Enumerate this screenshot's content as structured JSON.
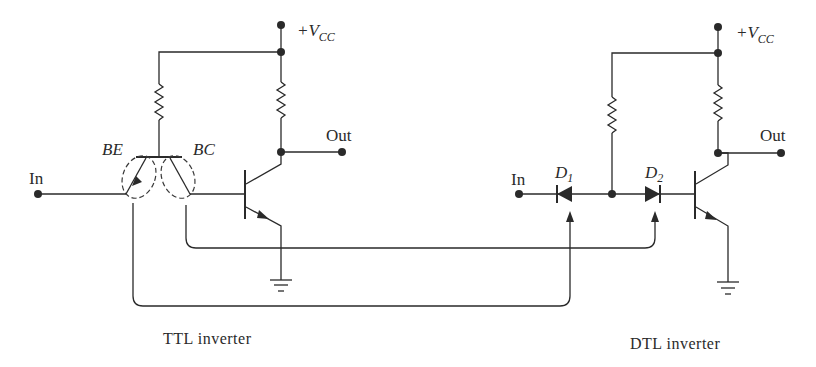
{
  "figure": {
    "type": "circuit-diagram",
    "colors": {
      "ink": "#2a2a2a",
      "background": "#ffffff"
    }
  },
  "ttl": {
    "caption": "TTL inverter",
    "supply_label_prefix": "+V",
    "supply_label_sub": "CC",
    "out_label": "Out",
    "in_label": "In",
    "junction_be_label": "BE",
    "junction_bc_label": "BC"
  },
  "dtl": {
    "caption": "DTL inverter",
    "supply_label_prefix": "+V",
    "supply_label_sub": "CC",
    "out_label": "Out",
    "in_label": "In",
    "d1_label": "D",
    "d1_sub": "1",
    "d2_label": "D",
    "d2_sub": "2"
  },
  "mapping": [
    {
      "from": "BE junction",
      "to": "D1"
    },
    {
      "from": "BC junction",
      "to": "D2"
    }
  ]
}
